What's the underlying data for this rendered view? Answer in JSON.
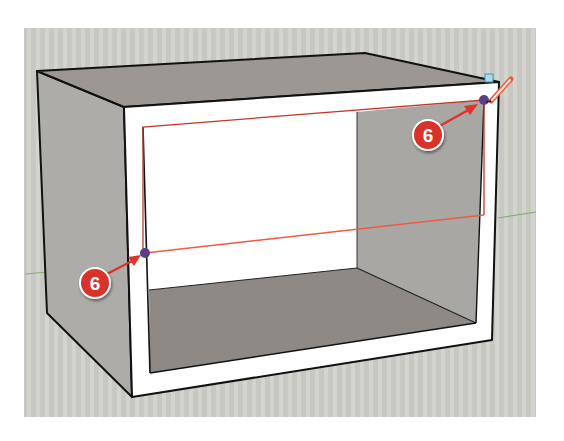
{
  "app": {
    "name": "3D modeling viewport",
    "tool_active": "pencil"
  },
  "viewport": {
    "background": "#c8c8c3",
    "stripe": "#d6d6d2"
  },
  "model": {
    "name": "open box",
    "colors": {
      "top_face": "#9c9792",
      "side_face": "#aeaca8",
      "floor": "#8e8985",
      "inner_right_wall": "#a9a7a3",
      "back_wall": "#ffffff",
      "frame": "#ffffff",
      "edge": "#111111"
    }
  },
  "axes": {
    "green_axis_color": "#7fb36a"
  },
  "guide_line": {
    "color": "#ef5a45",
    "label": "drawn edge"
  },
  "inference_points": [
    {
      "name": "endpoint-left",
      "color": "#5b3f86"
    },
    {
      "name": "endpoint-right",
      "color": "#5b3f86"
    }
  ],
  "callouts": [
    {
      "label": "6",
      "color": "#d8322a"
    },
    {
      "label": "6",
      "color": "#d8322a"
    }
  ],
  "cursor": {
    "icon": "pencil-icon",
    "color": "#ef5a3a",
    "snap_marker_color": "#a9dcec"
  }
}
